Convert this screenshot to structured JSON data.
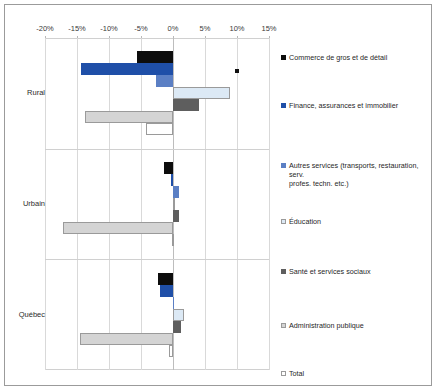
{
  "chart_data": {
    "type": "bar",
    "orientation": "horizontal",
    "title": "",
    "subtitle": "",
    "xlabel": "",
    "ylabel": "",
    "xlim": [
      -20,
      15
    ],
    "xticks": [
      -20,
      -15,
      -10,
      -5,
      0,
      5,
      10,
      15
    ],
    "xtick_labels": [
      "-20%",
      "-15%",
      "-10%",
      "-5%",
      "0%",
      "5%",
      "10%",
      "15%"
    ],
    "grid": true,
    "legend_position": "right",
    "categories": [
      "Rural",
      "Urbain",
      "Québec"
    ],
    "series": [
      {
        "name": "Commerce de gros et de détail",
        "color": "#0d0d0d",
        "outlined": false,
        "values": [
          -5.6,
          -1.4,
          -2.4
        ]
      },
      {
        "name": "Finance, assurances et immobilier",
        "color": "#1f4fa8",
        "outlined": false,
        "values": [
          -14.4,
          -0.3,
          -2.1
        ]
      },
      {
        "name": "Autres services (transports, restauration, serv. profes. techn. etc.)",
        "color": "#5b7fc4",
        "outlined": false,
        "values": [
          -2.6,
          0.9,
          0.1
        ]
      },
      {
        "name": "Éducation",
        "color": "#dce9f5",
        "outlined": true,
        "values": [
          8.9,
          0.3,
          1.7
        ]
      },
      {
        "name": "Santé et services sociaux",
        "color": "#5e5e5e",
        "outlined": false,
        "values": [
          4.0,
          0.9,
          1.3
        ]
      },
      {
        "name": "Administration publique",
        "color": "#d4d4d4",
        "outlined": true,
        "values": [
          -13.7,
          -17.2,
          -14.5
        ]
      },
      {
        "name": "Total",
        "color": "#ffffff",
        "outlined": true,
        "values": [
          -4.2,
          -0.1,
          -0.6
        ]
      }
    ],
    "annotations": [
      {
        "name": "rural-marker",
        "x": 10.0,
        "group": "Rural",
        "series_index": 0,
        "shape": "square",
        "color": "#111111"
      }
    ]
  },
  "legend": {
    "items": [
      "Commerce de gros et de détail",
      "Finance, assurances et immobilier",
      "Autres services (transports, restauration, serv.\nprofes. techn. etc.)",
      "Éducation",
      "Santé et services sociaux",
      "Administration publique",
      "Total"
    ]
  },
  "colors": {
    "commerce": "#0d0d0d",
    "finance": "#1f4fa8",
    "autres_services": "#5b7fc4",
    "education": "#dce9f5",
    "sante": "#5e5e5e",
    "administration": "#d4d4d4",
    "total": "#ffffff",
    "grid": "#d9d9d9",
    "frame": "#9b9b9b"
  }
}
